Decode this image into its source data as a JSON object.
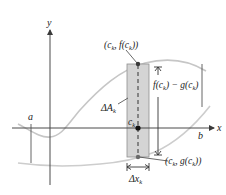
{
  "diagram": {
    "colors": {
      "axis": "#4a4a4a",
      "curve": "#c8c8c8",
      "rect_fill": "#d4d4d4",
      "rect_stroke": "#8a8a8a",
      "text": "#222222",
      "point": "#111111",
      "point_gray": "#6a6a6a"
    },
    "axes": {
      "x_label": "x",
      "y_label": "y"
    },
    "bounds": {
      "a_label": "a",
      "b_label": "b"
    },
    "rectangle": {
      "area_label": "ΔA",
      "area_subscript": "k",
      "width_label": "Δx",
      "width_subscript": "k"
    },
    "points": {
      "top": {
        "label_pre": "(c",
        "sub1": "k",
        "label_mid": ", f(c",
        "sub2": "k",
        "label_post": "))"
      },
      "center": {
        "label": "c",
        "sub": "k"
      },
      "bottom": {
        "label_pre": "(c",
        "sub1": "k",
        "label_mid": ", g(c",
        "sub2": "k",
        "label_post": "))"
      }
    },
    "height_label": {
      "pre": "f(c",
      "sub1": "k",
      "mid": ") − g(c",
      "sub2": "k",
      "post": ")"
    }
  }
}
